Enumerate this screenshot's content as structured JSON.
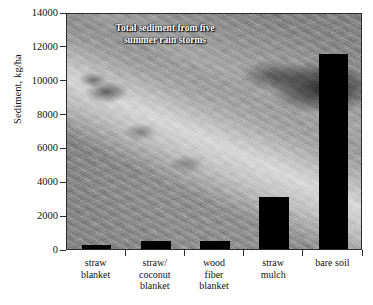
{
  "chart_data": {
    "type": "bar",
    "title": "",
    "annotation": "Total sediment from five summer rain storms",
    "annotation_lines": [
      "Total sediment from five",
      "summer rain storms"
    ],
    "xlabel": "",
    "ylabel": "Sediment, kg/ha",
    "ylim": [
      0,
      14000
    ],
    "ytick_step": 2000,
    "yticks": [
      0,
      2000,
      4000,
      6000,
      8000,
      10000,
      12000,
      14000
    ],
    "ytick_labels": [
      "0",
      "2000",
      "4000",
      "6000",
      "8000",
      "10000",
      "12000",
      "14000"
    ],
    "grid": false,
    "legend": false,
    "categories": [
      "straw blanket",
      "straw/coconut blanket",
      "wood fiber blanket",
      "straw mulch",
      "bare soil"
    ],
    "category_lines": [
      [
        "straw",
        "blanket"
      ],
      [
        "straw/",
        "coconut",
        "blanket"
      ],
      [
        "wood",
        "fiber",
        "blanket"
      ],
      [
        "straw",
        "mulch"
      ],
      [
        "bare soil"
      ]
    ],
    "values": [
      250,
      480,
      480,
      3100,
      11500
    ],
    "units": "kg/ha",
    "bar_color": "#000000",
    "plot_background": "photograph-grayscale-erosion-control-blanket-slope"
  }
}
